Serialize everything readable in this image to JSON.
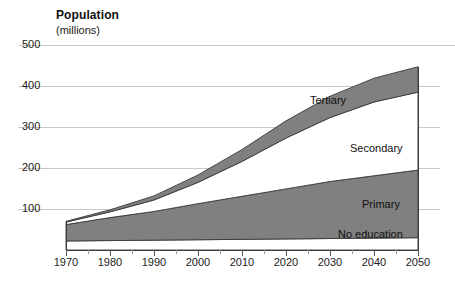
{
  "title": "Population",
  "subtitle": "(millions)",
  "colors": {
    "band_gray": "#808080",
    "band_white": "#ffffff",
    "gridline": "#c9c9c9",
    "axis": "#555555",
    "text": "#1a1a1a"
  },
  "axis": {
    "y_ticks": [
      "100",
      "200",
      "300",
      "400",
      "500"
    ],
    "x_ticks": [
      "1970",
      "1980",
      "1990",
      "2000",
      "2010",
      "2020",
      "2030",
      "2040",
      "2050"
    ]
  },
  "series_labels": {
    "tertiary": "Tertiary",
    "secondary": "Secondary",
    "primary": "Primary",
    "no_education": "No education"
  },
  "chart_data": {
    "type": "area",
    "title": "Population",
    "xlabel": "",
    "ylabel": "Population (millions)",
    "xlim": [
      1970,
      2050
    ],
    "ylim": [
      0,
      500
    ],
    "grid": true,
    "legend": "inline-annotations",
    "stacked": true,
    "x": [
      1970,
      1980,
      1990,
      2000,
      2010,
      2020,
      2030,
      2040,
      2050
    ],
    "series": [
      {
        "name": "No education",
        "values": [
          22,
          23,
          24,
          25,
          26,
          27,
          28,
          29,
          30
        ]
      },
      {
        "name": "Primary",
        "values": [
          40,
          56,
          70,
          88,
          105,
          122,
          139,
          152,
          165
        ]
      },
      {
        "name": "Secondary",
        "values": [
          6,
          14,
          28,
          52,
          85,
          124,
          156,
          180,
          190
        ]
      },
      {
        "name": "Tertiary",
        "values": [
          2,
          5,
          10,
          18,
          29,
          42,
          52,
          58,
          62
        ]
      }
    ],
    "totals": [
      70,
      98,
      132,
      183,
      245,
      315,
      375,
      419,
      447
    ],
    "y_ticks": [
      100,
      200,
      300,
      400,
      500
    ],
    "x_ticks": [
      1970,
      1980,
      1990,
      2000,
      2010,
      2020,
      2030,
      2040,
      2050
    ],
    "x_minor_tick_step": 5
  }
}
